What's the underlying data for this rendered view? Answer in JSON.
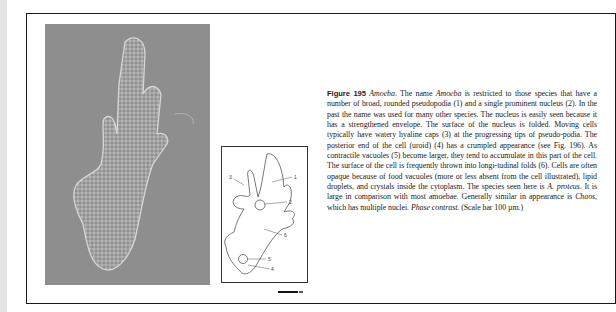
{
  "figure": {
    "label": "Figure 195",
    "genus": "Amoeba",
    "caption_segments": [
      {
        "t": "The name ",
        "i": false
      },
      {
        "t": "Amoeba",
        "i": true
      },
      {
        "t": " is restricted to those species that have a number of broad, rounded pseudopodia (1) and a single prominent nucleus (2). In the past the name was used for many other species. The nucleus is easily seen because it has a strengthened envelope. The surface of the nucleus is folded. Moving cells typically have watery hyaline caps (3) at the progressing tips of pseudo-podia. The posterior end of the cell (uroid) (4) has a crumpled appearance (see Fig. 196). As contractile vacuoles (5) become larger, they tend to accumulate in this part of the cell. The surface of the cell is frequently thrown into longi-tudinal folds (6). Cells are often opaque because of food vacuoles (more or less absent from the cell illustrated), lipid droplets, and crystals inside the cytoplasm. The species seen here is ",
        "i": false
      },
      {
        "t": "A. proteus",
        "i": true
      },
      {
        "t": ". It is large in comparison with most amoebae. Generally similar in appearance is ",
        "i": false
      },
      {
        "t": "Chaos",
        "i": true
      },
      {
        "t": ", which has multiple nuclei. ",
        "i": false
      },
      {
        "t": "Phase contrast.",
        "i": true
      },
      {
        "t": " (Scale bar 100 µm.)",
        "i": false
      }
    ]
  },
  "diagram": {
    "labels": [
      "1",
      "2",
      "3",
      "4",
      "5",
      "6"
    ]
  },
  "colors": {
    "photo_background": "#8d8d8d",
    "frame": "#1a1a1a"
  }
}
